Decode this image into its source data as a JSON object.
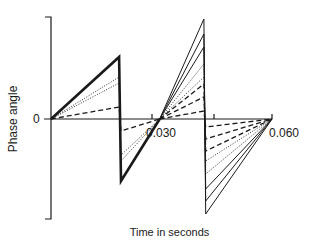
{
  "chart_data": {
    "type": "line",
    "title": "",
    "xlabel": "Time in seconds",
    "ylabel": "Phase angle",
    "x_ticks": [
      "0.030",
      "0.060"
    ],
    "y_ticks": [
      "0"
    ],
    "xlim": [
      0,
      0.06
    ],
    "grid": false,
    "legend": "none",
    "series": [
      {
        "name": "solid-heavy",
        "style": "solid",
        "points": [
          [
            0,
            0
          ],
          [
            0.0185,
            0.62
          ],
          [
            0.019,
            -0.62
          ],
          [
            0.0295,
            0
          ]
        ]
      },
      {
        "name": "dotted-1",
        "style": "dotted",
        "points": [
          [
            0,
            0
          ],
          [
            0.0185,
            0.42
          ],
          [
            0.019,
            -0.42
          ],
          [
            0.0295,
            0
          ]
        ]
      },
      {
        "name": "dotted-2",
        "style": "dotted",
        "points": [
          [
            0,
            0
          ],
          [
            0.0185,
            0.36
          ],
          [
            0.019,
            -0.36
          ],
          [
            0.0295,
            0
          ]
        ]
      },
      {
        "name": "dashed-1",
        "style": "dashed",
        "points": [
          [
            0,
            0
          ],
          [
            0.0185,
            0.12
          ],
          [
            0.019,
            -0.12
          ],
          [
            0.0295,
            0
          ]
        ]
      },
      {
        "name": "solid-c2-1",
        "style": "solid",
        "points": [
          [
            0.0295,
            0
          ],
          [
            0.0415,
            1.0
          ],
          [
            0.042,
            -0.95
          ],
          [
            0.06,
            0
          ]
        ]
      },
      {
        "name": "solid-c2-2",
        "style": "solid",
        "points": [
          [
            0.0295,
            0
          ],
          [
            0.0415,
            0.85
          ],
          [
            0.042,
            -0.82
          ],
          [
            0.06,
            0
          ]
        ]
      },
      {
        "name": "solid-c2-3",
        "style": "solid",
        "points": [
          [
            0.0295,
            0
          ],
          [
            0.0415,
            0.72
          ],
          [
            0.042,
            -0.7
          ],
          [
            0.06,
            0
          ]
        ]
      },
      {
        "name": "dotted-c2-1",
        "style": "dotted",
        "points": [
          [
            0.0295,
            0
          ],
          [
            0.0415,
            0.55
          ],
          [
            0.042,
            -0.55
          ],
          [
            0.06,
            0
          ]
        ]
      },
      {
        "name": "dotted-c2-2",
        "style": "dotted",
        "points": [
          [
            0.0295,
            0
          ],
          [
            0.0415,
            0.42
          ],
          [
            0.042,
            -0.42
          ],
          [
            0.06,
            0
          ]
        ]
      },
      {
        "name": "dashed-c2-1",
        "style": "dashed",
        "points": [
          [
            0.0295,
            0
          ],
          [
            0.0415,
            0.35
          ],
          [
            0.042,
            -0.32
          ],
          [
            0.06,
            0
          ]
        ]
      },
      {
        "name": "dashed-c2-2",
        "style": "dashed",
        "points": [
          [
            0.0295,
            0
          ],
          [
            0.0415,
            0.22
          ],
          [
            0.042,
            -0.2
          ],
          [
            0.06,
            0
          ]
        ]
      },
      {
        "name": "dashed-c2-3",
        "style": "dashed",
        "points": [
          [
            0.0295,
            0
          ],
          [
            0.0415,
            0.08
          ],
          [
            0.042,
            -0.08
          ],
          [
            0.06,
            0
          ]
        ]
      }
    ]
  },
  "labels": {
    "ylabel": "Phase angle",
    "xlabel": "Time in seconds",
    "zero": "0",
    "tick_030": "0.030",
    "tick_060": "0.060"
  }
}
